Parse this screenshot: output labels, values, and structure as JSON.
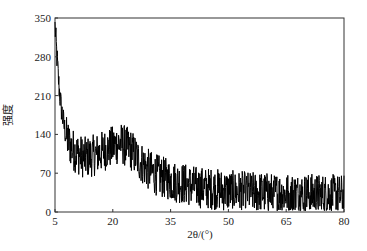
{
  "chart_data": {
    "type": "line",
    "title": "",
    "xlabel": "2θ/(°)",
    "ylabel": "强度",
    "xlim": [
      5,
      80
    ],
    "ylim": [
      0,
      350
    ],
    "xticks": [
      5,
      20,
      35,
      50,
      65,
      80
    ],
    "yticks": [
      0,
      70,
      140,
      210,
      280,
      350
    ],
    "grid": false,
    "legend": null,
    "series": [
      {
        "name": "XRD pattern",
        "color": "#000000",
        "x": [
          5,
          5.5,
          6,
          6.5,
          7,
          7.5,
          8,
          9,
          10,
          11,
          12,
          13,
          14,
          15,
          16,
          17,
          18,
          19,
          20,
          21,
          22,
          23,
          24,
          25,
          26,
          27,
          28,
          29,
          30,
          32,
          34,
          36,
          38,
          40,
          42,
          44,
          46,
          48,
          50,
          52,
          54,
          56,
          58,
          60,
          62,
          64,
          66,
          68,
          70,
          72,
          74,
          76,
          78,
          80
        ],
        "values": [
          335,
          280,
          230,
          195,
          170,
          150,
          135,
          120,
          110,
          105,
          100,
          98,
          100,
          102,
          105,
          108,
          112,
          115,
          118,
          122,
          125,
          120,
          115,
          110,
          100,
          92,
          85,
          78,
          72,
          65,
          60,
          55,
          52,
          48,
          45,
          43,
          42,
          40,
          38,
          37,
          36,
          35,
          35,
          34,
          34,
          33,
          33,
          32,
          32,
          32,
          31,
          31,
          30,
          30
        ]
      }
    ],
    "annotations": [
      "broad amorphous hump centered near 2θ ≈ 22°",
      "noisy signal, noise amplitude ≈ ±40"
    ]
  },
  "axes": {
    "x_label": "2θ/(°)",
    "y_label": "强度",
    "x_tick_labels": [
      "5",
      "20",
      "35",
      "50",
      "65",
      "80"
    ],
    "y_tick_labels": [
      "0",
      "70",
      "140",
      "210",
      "280",
      "350"
    ]
  }
}
